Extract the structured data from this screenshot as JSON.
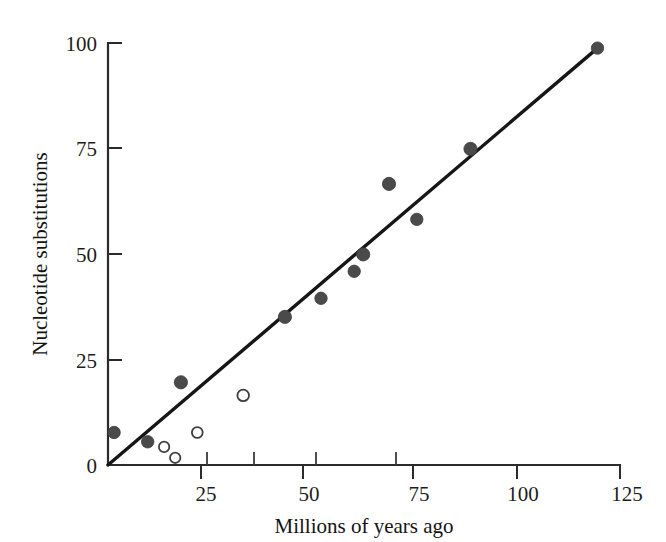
{
  "chart_data": {
    "type": "scatter",
    "title": "",
    "xlabel": "Millions of years ago",
    "ylabel": "Nucleotide substitutions",
    "xlim": [
      0,
      125
    ],
    "ylim": [
      0,
      100
    ],
    "xticks": [
      0,
      25,
      50,
      75,
      100,
      125
    ],
    "xtick_labels": [
      "0",
      "25",
      "50",
      "75",
      "100",
      "125"
    ],
    "yticks": [
      0,
      25,
      50,
      75,
      100
    ],
    "ytick_labels": [
      "0",
      "25",
      "50",
      "75",
      "100"
    ],
    "grid": false,
    "legend": null,
    "series": [
      {
        "name": "filled-points",
        "marker": "filled-circle",
        "color": "#4a4a4a",
        "points": [
          {
            "x": 1.5,
            "y": 7.7
          },
          {
            "x": 9.7,
            "y": 5.5
          },
          {
            "x": 17.8,
            "y": 19.6
          },
          {
            "x": 43.2,
            "y": 35.1
          },
          {
            "x": 52.0,
            "y": 39.5
          },
          {
            "x": 60.1,
            "y": 45.9
          },
          {
            "x": 62.3,
            "y": 49.9
          },
          {
            "x": 68.6,
            "y": 66.6
          },
          {
            "x": 75.4,
            "y": 58.2
          },
          {
            "x": 88.5,
            "y": 74.9
          },
          {
            "x": 119.5,
            "y": 98.8
          }
        ]
      },
      {
        "name": "open-points",
        "marker": "open-circle",
        "color": "#ffffff",
        "points": [
          {
            "x": 13.7,
            "y": 4.3
          },
          {
            "x": 16.4,
            "y": 1.7
          },
          {
            "x": 21.8,
            "y": 7.7
          },
          {
            "x": 33.0,
            "y": 16.5
          }
        ]
      }
    ],
    "fit_line": {
      "name": "regression-line",
      "from": {
        "x": 0,
        "y": 0
      },
      "to": {
        "x": 119.5,
        "y": 98.8
      },
      "color": "#161616"
    },
    "axis_data_ticks_x": [
      22.5,
      35.5,
      50.5,
      75.0
    ],
    "annotations": []
  },
  "colors": {
    "background": "#ffffff",
    "axis": "#2b2b2b",
    "line": "#161616",
    "filled_marker": "#4a4a4a",
    "open_marker_stroke": "#3f3f3f",
    "text": "#141414"
  }
}
